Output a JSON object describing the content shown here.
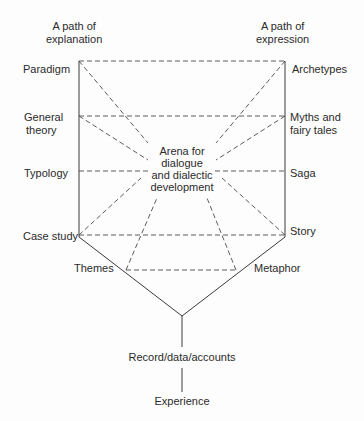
{
  "headers": {
    "left": [
      "A path of",
      "explanation"
    ],
    "right": [
      "A path of",
      "expression"
    ]
  },
  "left_levels": {
    "paradigm": "Paradigm",
    "general_theory": [
      "General",
      "theory"
    ],
    "typology": "Typology",
    "case_study": "Case study"
  },
  "right_levels": {
    "archetypes": "Archetypes",
    "myths": [
      "Myths and",
      "fairy tales"
    ],
    "saga": "Saga",
    "story": "Story"
  },
  "lower": {
    "themes": "Themes",
    "metaphor": "Metaphor",
    "record": "Record/data/accounts",
    "experience": "Experience"
  },
  "center": [
    "Arena for",
    "dialogue",
    "and dialectic",
    "development"
  ]
}
